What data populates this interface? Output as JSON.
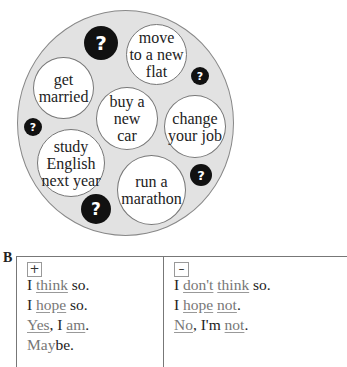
{
  "diagram": {
    "bubbles": [
      {
        "id": "move",
        "lines": [
          "move",
          "to a new",
          "flat"
        ]
      },
      {
        "id": "married",
        "lines": [
          "get",
          "married"
        ]
      },
      {
        "id": "car",
        "lines": [
          "buy a",
          "new",
          "car"
        ]
      },
      {
        "id": "job",
        "lines": [
          "change",
          "your job"
        ]
      },
      {
        "id": "study",
        "lines": [
          "study",
          "English",
          "next year"
        ]
      },
      {
        "id": "marathon",
        "lines": [
          "run a",
          "marathon"
        ]
      }
    ],
    "question_mark": "?"
  },
  "section_b": {
    "label": "B",
    "positive": {
      "sign": "+",
      "lines": [
        {
          "parts": [
            {
              "t": "I "
            },
            {
              "t": "think",
              "u": true
            },
            {
              "t": " so."
            }
          ]
        },
        {
          "parts": [
            {
              "t": "I "
            },
            {
              "t": "hope",
              "u": true
            },
            {
              "t": " so."
            }
          ]
        },
        {
          "parts": [
            {
              "t": "Yes",
              "u": true
            },
            {
              "t": ", I "
            },
            {
              "t": "am",
              "u": true
            },
            {
              "t": "."
            }
          ]
        },
        {
          "parts": [
            {
              "t": "May",
              "u": true,
              "nounder": true
            },
            {
              "t": "be."
            }
          ]
        }
      ]
    },
    "negative": {
      "sign": "–",
      "lines": [
        {
          "parts": [
            {
              "t": "I "
            },
            {
              "t": "don't",
              "u": true
            },
            {
              "t": " "
            },
            {
              "t": "think",
              "u": true
            },
            {
              "t": " so."
            }
          ]
        },
        {
          "parts": [
            {
              "t": "I "
            },
            {
              "t": "hope",
              "u": true
            },
            {
              "t": " "
            },
            {
              "t": "not",
              "u": true
            },
            {
              "t": "."
            }
          ]
        },
        {
          "parts": [
            {
              "t": "No",
              "u": true
            },
            {
              "t": ", I'm "
            },
            {
              "t": "not",
              "u": true
            },
            {
              "t": "."
            }
          ]
        }
      ]
    }
  }
}
